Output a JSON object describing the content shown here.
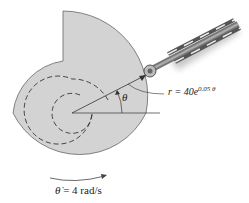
{
  "figure": {
    "equation": {
      "lhs": "r = 40e",
      "exponent": "0.05 θ"
    },
    "angle_label": "θ",
    "angular_velocity": {
      "symbol": "θ̇",
      "value": "= 4 rad/s"
    },
    "colors": {
      "cam_fill": "#d3d3d3",
      "outline": "#555555",
      "rod": "#666666",
      "shadow": "#b0b0b0"
    }
  }
}
